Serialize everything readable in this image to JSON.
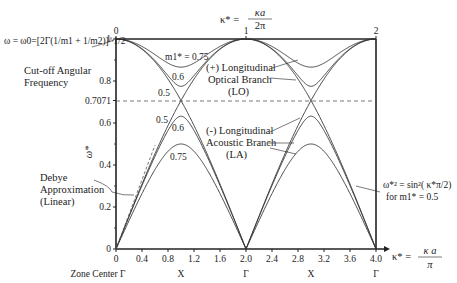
{
  "chart_data": {
    "type": "line",
    "title": "",
    "xlabel": "κ* = κa/π",
    "xlabel_top": "κ* = κa/2π",
    "ylabel": "ω*",
    "xlim": [
      0,
      4
    ],
    "ylim": [
      0,
      1
    ],
    "x_ticks": [
      "0",
      "0.4",
      "0.8",
      "1.2",
      "1.6",
      "2.0",
      "2.4",
      "2.8",
      "3.2",
      "3.6",
      "4.0"
    ],
    "x_tick_values": [
      0,
      0.4,
      0.8,
      1.2,
      1.6,
      2.0,
      2.4,
      2.8,
      3.2,
      3.6,
      4.0
    ],
    "x_symmetry_labels": [
      {
        "x": 0,
        "label": "Zone Center Γ"
      },
      {
        "x": 1,
        "label": "X"
      },
      {
        "x": 2,
        "label": "Γ"
      },
      {
        "x": 3,
        "label": "X"
      },
      {
        "x": 4,
        "label": "Γ"
      }
    ],
    "top_ticks": [
      {
        "x": 0,
        "label": "0"
      },
      {
        "x": 2,
        "label": "1"
      },
      {
        "x": 4,
        "label": "2"
      }
    ],
    "y_ticks": [
      "0",
      "0.2",
      "0.4",
      "0.6",
      "0.7071",
      "0.8",
      "1"
    ],
    "y_tick_values": [
      0,
      0.2,
      0.4,
      0.6,
      0.7071,
      0.8,
      1
    ],
    "reference_line": {
      "y": 0.7071,
      "style": "dashed"
    },
    "dispersion_formula": "ω*² = ½[1 ± √(1 − 4 m1* (1 − m1*) sin²(κ*π/2))]",
    "series": [
      {
        "name": "LO m1*=0.75",
        "branch": "optical",
        "m1": 0.75,
        "min_at_X": 0.866
      },
      {
        "name": "LO m1*=0.6",
        "branch": "optical",
        "m1": 0.6,
        "min_at_X": 0.775
      },
      {
        "name": "LO m1*=0.5",
        "branch": "optical",
        "m1": 0.5,
        "min_at_X": 0.7071
      },
      {
        "name": "LA m1*=0.5",
        "branch": "acoustic",
        "m1": 0.5,
        "max_at_X": 0.7071
      },
      {
        "name": "LA m1*=0.6",
        "branch": "acoustic",
        "m1": 0.6,
        "max_at_X": 0.632
      },
      {
        "name": "LA m1*=0.75",
        "branch": "acoustic",
        "m1": 0.75,
        "max_at_X": 0.5
      },
      {
        "name": "Debye Approximation (Linear)",
        "branch": "debye",
        "style": "dashed"
      }
    ],
    "curve_labels": {
      "lo_075": "m1* = 0.75",
      "lo_06": "0.6",
      "lo_05": "0.5",
      "la_05": "0.5",
      "la_06": "0.6",
      "la_075": "0.75"
    },
    "annotations": {
      "cutoff_formula": "ω = ω0=[2Γ(1/m1 + 1/m2)]^1/2",
      "cutoff_line1": "Cut-off Angular",
      "cutoff_line2": "Frequency",
      "lo_line1": "(+) Longitudinal",
      "lo_line2": "Optical Branch",
      "lo_line3": "(LO)",
      "la_line1": "(-) Longitudinal",
      "la_line2": "Acoustic Branch",
      "la_line3": "(LA)",
      "debye_line1": "Debye",
      "debye_line2": "Approximation",
      "debye_line3": "(Linear)",
      "sin_line1": "ω*² = sin²( κ*π/2)",
      "sin_line2": "for m1* = 0.5"
    },
    "colors": {
      "curve": "#333333",
      "axis": "#222222",
      "dash": "#555555"
    }
  }
}
